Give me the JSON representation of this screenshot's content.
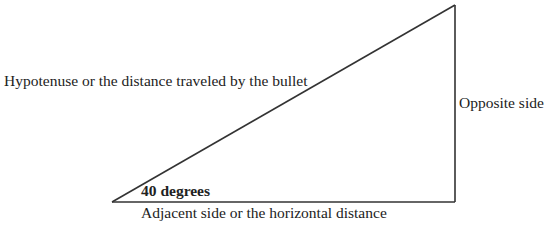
{
  "diagram": {
    "type": "right-triangle",
    "labels": {
      "hypotenuse": "Hypotenuse or the distance traveled by the bullet",
      "opposite": "Opposite side",
      "adjacent": "Adjacent side or the horizontal distance",
      "angle": "40 degrees"
    },
    "vertices": {
      "angle_vertex": [
        112,
        202
      ],
      "right_angle_vertex": [
        455,
        202
      ],
      "top_vertex": [
        455,
        5
      ]
    },
    "stroke_color": "#333333"
  }
}
